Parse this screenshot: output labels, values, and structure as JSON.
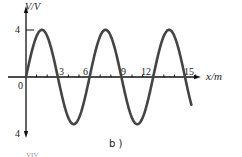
{
  "figure": {
    "caption": "b )",
    "y_axis_label": "V/V",
    "x_axis_label": "x/m",
    "origin_label": "0",
    "y_top_label": "4",
    "y_bottom_label": "4",
    "x_tick_labels": [
      "3",
      "6",
      "9",
      "12",
      "15"
    ],
    "footer_fragment": "VIV"
  },
  "chart_data": {
    "type": "line",
    "title": "",
    "caption": "b )",
    "xlabel": "x/m",
    "ylabel": "V/V",
    "xlim": [
      0,
      16
    ],
    "ylim": [
      -4,
      4
    ],
    "xticks": [
      3,
      6,
      9,
      12,
      15
    ],
    "yticks": [
      4,
      -4
    ],
    "ytick_labels": [
      "4",
      "4"
    ],
    "grid": false,
    "series": [
      {
        "name": "wave",
        "function": "4*sin(2*pi*x/6)",
        "amplitude": 4,
        "wavelength": 6,
        "x": [
          0,
          1.5,
          3,
          4.5,
          6,
          7.5,
          9,
          10.5,
          12,
          13.5,
          15,
          15.6
        ],
        "y": [
          0,
          4,
          0,
          -4,
          0,
          4,
          0,
          -4,
          0,
          4,
          0,
          -2.4
        ]
      }
    ],
    "colors": {
      "curve": "#444444",
      "axes": "#111111"
    }
  }
}
